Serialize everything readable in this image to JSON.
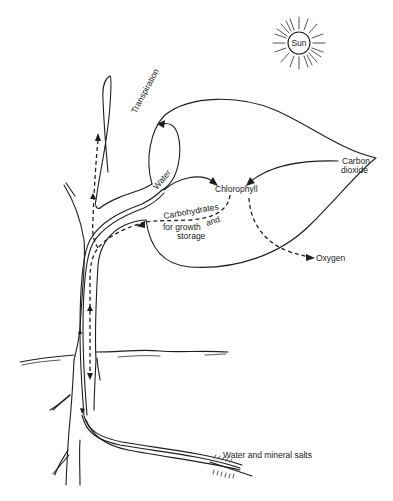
{
  "diagram": {
    "type": "plant photosynthesis and transport diagram",
    "labels": {
      "sun": "Sun",
      "transpiration": "Transpiration",
      "water": "Water",
      "chlorophyll": "Chlorophyll",
      "carbon_dioxide_line1": "Carbon",
      "carbon_dioxide_line2": "dioxide",
      "carbohydrates_line1": "Carbohydrates",
      "carbohydrates_line2": "for growth",
      "carbohydrates_and": "and",
      "carbohydrates_line3": "storage",
      "oxygen": "Oxygen",
      "water_and_minerals": "Water and mineral salts"
    },
    "elements": [
      {
        "id": "sun",
        "kind": "circle-with-rays"
      },
      {
        "id": "stem",
        "kind": "plant stem with branches"
      },
      {
        "id": "leaf",
        "kind": "large pointed leaf"
      },
      {
        "id": "ground-line",
        "kind": "soil surface"
      },
      {
        "id": "root",
        "kind": "root with root hairs"
      }
    ],
    "flows": [
      {
        "from": "Water and mineral salts",
        "to": "Chlorophyll",
        "style": "solid",
        "via": "root and stem (xylem)"
      },
      {
        "from": "Water",
        "to": "Transpiration",
        "style": "solid"
      },
      {
        "from": "Carbon dioxide",
        "to": "Chlorophyll",
        "style": "solid"
      },
      {
        "from": "Chlorophyll",
        "to": "Oxygen",
        "style": "dashed"
      },
      {
        "from": "Chlorophyll",
        "to": "Carbohydrates for growth and storage",
        "style": "dashed",
        "via": "stem (phloem), up and down"
      }
    ]
  }
}
